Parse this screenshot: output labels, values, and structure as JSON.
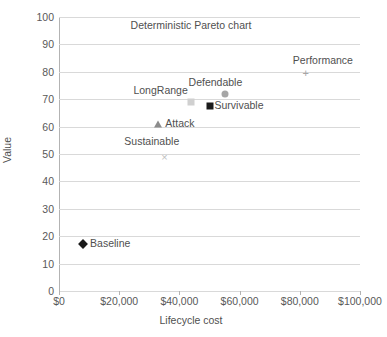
{
  "chart_data": {
    "type": "scatter",
    "title": "Deterministic Pareto chart",
    "xlabel": "Lifecycle cost",
    "ylabel": "Value",
    "xlim": [
      0,
      100000
    ],
    "ylim": [
      0,
      100
    ],
    "grid": "horizontal",
    "legend": "none (points labeled inline)",
    "x_ticks": [
      "$0",
      "$20,000",
      "$40,000",
      "$60,000",
      "$80,000",
      "$100,000"
    ],
    "x_tick_values": [
      0,
      20000,
      40000,
      60000,
      80000,
      100000
    ],
    "y_ticks": [
      "0",
      "10",
      "20",
      "30",
      "40",
      "50",
      "60",
      "70",
      "80",
      "90",
      "100"
    ],
    "y_tick_values": [
      0,
      10,
      20,
      30,
      40,
      50,
      60,
      70,
      80,
      90,
      100
    ],
    "points": [
      {
        "name": "Baseline",
        "x": 8000,
        "y": 17,
        "marker": "diamond",
        "color": "#1a1a1a",
        "label_dx": 7,
        "label_dy": -6
      },
      {
        "name": "Sustainable",
        "x": 35000,
        "y": 49,
        "marker": "cross",
        "color": "#bfbfbf",
        "label_dx": -40,
        "label_dy": -21
      },
      {
        "name": "Attack",
        "x": 33000,
        "y": 61,
        "marker": "triangle",
        "color": "#8c8c8c",
        "label_dx": 7,
        "label_dy": -6
      },
      {
        "name": "LongRange",
        "x": 44000,
        "y": 69,
        "marker": "square",
        "color": "#d0d0d0",
        "label_dx": -58,
        "label_dy": -17
      },
      {
        "name": "Survivable",
        "x": 50000,
        "y": 67.5,
        "marker": "square",
        "color": "#1a1a1a",
        "label_dx": 5,
        "label_dy": -6
      },
      {
        "name": "Defendable",
        "x": 55000,
        "y": 72,
        "marker": "circle",
        "color": "#a6a6a6",
        "label_dx": -36,
        "label_dy": -17
      },
      {
        "name": "Performance",
        "x": 82000,
        "y": 79.5,
        "marker": "plus",
        "color": "#a6a6a6",
        "label_dx": -13,
        "label_dy": -18
      }
    ]
  },
  "glyphs": {
    "cross": "×",
    "plus": "+"
  }
}
